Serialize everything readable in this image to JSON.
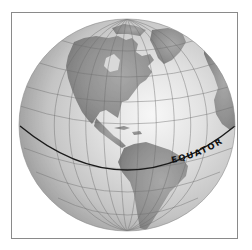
{
  "figure": {
    "type": "globe-diagram",
    "view": "Western Hemisphere (Americas)",
    "labels": {
      "equator": "EQUATOR"
    },
    "colors": {
      "frame_border": "#8a8a8a",
      "ocean_light": "#f4f4f4",
      "ocean_mid": "#cfcfcf",
      "ocean_dark": "#9a9a9a",
      "land": "#8f8f8f",
      "graticule": "#6e6e6e",
      "equator_line": "#1a1a1a",
      "label_text": "#111111"
    },
    "geometry": {
      "globe_center": [
        127,
        125
      ],
      "globe_radius": 107,
      "equator_endpoints": [
        [
          20,
          126
        ],
        [
          235,
          126
        ]
      ],
      "equator_lowest_y": 170
    },
    "landmasses": [
      "North America",
      "Greenland",
      "Central America",
      "Caribbean islands",
      "South America",
      "Western Europe / Africa edge"
    ]
  }
}
